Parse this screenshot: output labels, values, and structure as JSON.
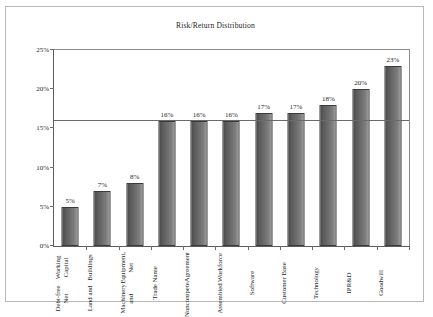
{
  "chart_data": {
    "type": "bar",
    "title": "Risk/Return Distribution",
    "xlabel": "",
    "ylabel": "",
    "ylim": [
      0,
      25
    ],
    "ytick_labels": [
      "0%",
      "5%",
      "10%",
      "15%",
      "20%",
      "25%"
    ],
    "ytick_values": [
      0,
      5,
      10,
      15,
      20,
      25
    ],
    "grid": false,
    "legend": "none",
    "value_suffix": "%",
    "categories": [
      "Debt-free Net Working Capital",
      "Land and Buildings",
      "Machinery and Equipment, Net",
      "Trade Name",
      "Noncompete Agreement",
      "Assembled Workforce",
      "Software",
      "Customer Base",
      "Technology",
      "IPR&D",
      "Goodwill"
    ],
    "category_lines": [
      [
        "Debt-free Net",
        "Working Capital"
      ],
      [
        "Land and",
        "Buildings"
      ],
      [
        "Machinery and",
        "Equipment, Net"
      ],
      [
        "Trade Name"
      ],
      [
        "Noncompete",
        "Agreement"
      ],
      [
        "Assembled",
        "Workforce"
      ],
      [
        "Software"
      ],
      [
        "Customer Base"
      ],
      [
        "Technology"
      ],
      [
        "IPR&D"
      ],
      [
        "Goodwill"
      ]
    ],
    "values": [
      5,
      7,
      8,
      16,
      16,
      16,
      17,
      17,
      18,
      20,
      23
    ],
    "data_labels": [
      "5%",
      "7%",
      "8%",
      "16%",
      "16%",
      "16%",
      "17%",
      "17%",
      "18%",
      "20%",
      "23%"
    ],
    "reference_line": {
      "value": 16,
      "label": ""
    },
    "colors": {
      "bar_dark": "#4a4a4a",
      "bar_light": "#a8a8a8",
      "bar_border": "#3a3a3a",
      "axis": "#5d5d5d",
      "reference_line": "#6a6a6a",
      "frame": "#b8b8b8",
      "background": "#ffffff",
      "text": "#1f1f1f"
    }
  }
}
